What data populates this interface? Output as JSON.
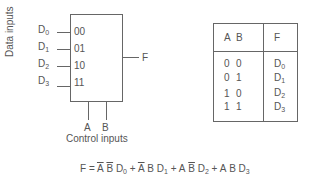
{
  "mux": {
    "y_axis_label": "Data inputs",
    "inputs": [
      {
        "name": "D",
        "sub": "0",
        "select": "00"
      },
      {
        "name": "D",
        "sub": "1",
        "select": "01"
      },
      {
        "name": "D",
        "sub": "2",
        "select": "10"
      },
      {
        "name": "D",
        "sub": "3",
        "select": "11"
      }
    ],
    "output": "F",
    "controls": [
      "A",
      "B"
    ],
    "control_label": "Control inputs"
  },
  "truth_table": {
    "headers": [
      "A",
      "B",
      "F"
    ],
    "rows": [
      {
        "a": "0",
        "b": "0",
        "f": "D",
        "fsub": "0"
      },
      {
        "a": "0",
        "b": "1",
        "f": "D",
        "fsub": "1"
      },
      {
        "a": "1",
        "b": "0",
        "f": "D",
        "fsub": "2"
      },
      {
        "a": "1",
        "b": "1",
        "f": "D",
        "fsub": "3"
      }
    ]
  },
  "equation": {
    "lhs": "F =",
    "terms": [
      {
        "a": "A",
        "a_bar": true,
        "b": "B",
        "b_bar": true,
        "d": "D",
        "sub": "0"
      },
      {
        "a": "A",
        "a_bar": true,
        "b": "B",
        "b_bar": false,
        "d": "D",
        "sub": "1"
      },
      {
        "a": "A",
        "a_bar": false,
        "b": "B",
        "b_bar": true,
        "d": "D",
        "sub": "2"
      },
      {
        "a": "A",
        "a_bar": false,
        "b": "B",
        "b_bar": false,
        "d": "D",
        "sub": "3"
      }
    ],
    "plus": "+"
  }
}
